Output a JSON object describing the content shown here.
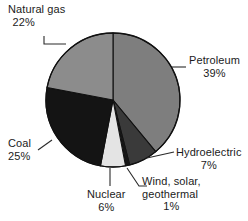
{
  "chart_data": {
    "type": "pie",
    "title": "",
    "subtitle": "",
    "xlabel": "",
    "ylabel": "",
    "grid": false,
    "legend_position": "callout-labels",
    "start_angle_deg": 0,
    "direction": "clockwise",
    "units": "percent",
    "total": 100,
    "categories": [
      "Petroleum",
      "Hydroelectric",
      "Wind, solar, geothermal",
      "Nuclear",
      "Coal",
      "Natural gas"
    ],
    "values": [
      39,
      7,
      1,
      6,
      25,
      22
    ],
    "slices": [
      {
        "label": "Petroleum",
        "value": 39,
        "value_text": "39%",
        "color": "#7e7e7e",
        "start_deg": 0,
        "end_deg": 140.4
      },
      {
        "label": "Hydroelectric",
        "value": 7,
        "value_text": "7%",
        "color": "#3a3a3a",
        "start_deg": 140.4,
        "end_deg": 165.6
      },
      {
        "label": "Wind, solar, geothermal",
        "value": 1,
        "value_text": "1%",
        "color": "#161616",
        "start_deg": 165.6,
        "end_deg": 169.2
      },
      {
        "label": "Nuclear",
        "value": 6,
        "value_text": "6%",
        "color": "#e4e4e4",
        "start_deg": 169.2,
        "end_deg": 190.8
      },
      {
        "label": "Coal",
        "value": 25,
        "value_text": "25%",
        "color": "#141414",
        "start_deg": 190.8,
        "end_deg": 280.8
      },
      {
        "label": "Natural gas",
        "value": 22,
        "value_text": "22%",
        "color": "#8c8c8c",
        "start_deg": 280.8,
        "end_deg": 360
      }
    ]
  },
  "labels": {
    "natural_gas": {
      "name": "Natural gas",
      "pct": "22%"
    },
    "petroleum": {
      "name": "Petroleum",
      "pct": "39%"
    },
    "coal": {
      "name": "Coal",
      "pct": "25%"
    },
    "hydroelectric": {
      "name": "Hydroelectric",
      "pct": "7%"
    },
    "nuclear": {
      "name": "Nuclear",
      "pct": "6%"
    },
    "wind": {
      "name_line1": "Wind, solar,",
      "name_line2": "geothermal",
      "pct": "1%"
    }
  },
  "style": {
    "background": "#ffffff",
    "outline": "#111111",
    "leader_line": "#2a2a2a",
    "text": "#1b1b1b"
  }
}
